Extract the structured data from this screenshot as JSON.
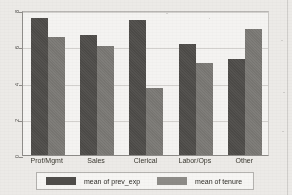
{
  "chart_data": {
    "type": "bar",
    "title": "",
    "subtitle": "",
    "xlabel": "",
    "ylabel": "",
    "categories": [
      "Prof/Mgmt",
      "Sales",
      "Clerical",
      "Labor/Ops",
      "Other"
    ],
    "series": [
      {
        "name": "mean of prev_exp",
        "color": "#4f4d4a",
        "values": [
          7.55,
          6.6,
          7.45,
          6.15,
          5.3
        ]
      },
      {
        "name": "mean of tenure",
        "color": "#7b7975",
        "values": [
          6.5,
          6.0,
          3.7,
          5.1,
          6.95
        ]
      }
    ],
    "ylim": [
      0,
      8
    ],
    "yticks": [
      0,
      2,
      4,
      6,
      8
    ],
    "ytick_labels": [
      "0",
      "2",
      "4",
      "6",
      "8"
    ],
    "grid": true,
    "grid_axis": "y",
    "legend_position": "bottom",
    "legend_entries": [
      "mean of prev_exp",
      "mean of tenure"
    ],
    "annotations": []
  },
  "figure": {
    "background_color": "#eceae7",
    "plot_background_color": "#f4f3f1",
    "axis_color": "#8e8c89",
    "gridline_color": "#d2d0cd"
  },
  "legend": {
    "entries": [
      {
        "label": "mean of prev_exp",
        "swatch_color": "#4f4d4a"
      },
      {
        "label": "mean of tenure",
        "swatch_color": "#8d8b87"
      }
    ]
  }
}
